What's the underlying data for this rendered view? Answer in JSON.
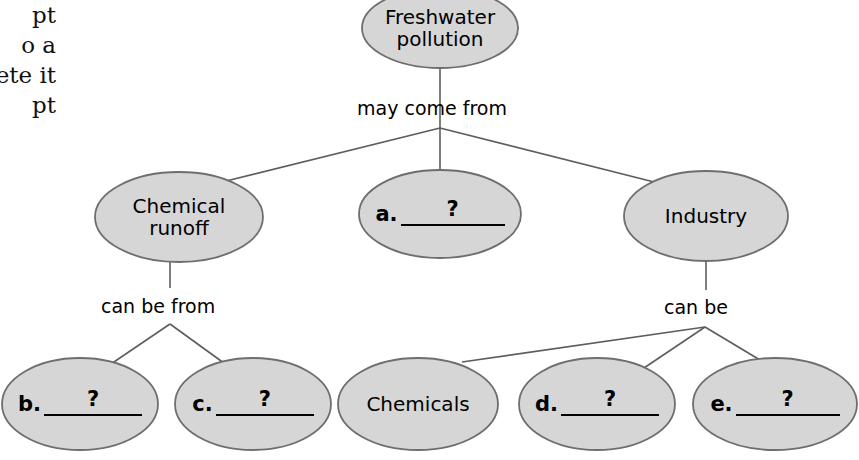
{
  "diagram": {
    "type": "concept-map",
    "colors": {
      "node_fill": "#d6d6d6",
      "node_stroke": "#6e6e6e",
      "edge_stroke": "#5d5d5d",
      "text": "#000000",
      "background": "#ffffff"
    },
    "margin_text": "pt\no a\nete it\npt",
    "nodes": [
      {
        "id": "root",
        "label": "Freshwater\npollution",
        "kind": "filled",
        "cx": 440,
        "cy": 28,
        "rx": 78,
        "ry": 40
      },
      {
        "id": "chemical-runoff",
        "label": "Chemical\nrunoff",
        "kind": "filled",
        "cx": 179,
        "cy": 217,
        "rx": 84,
        "ry": 45
      },
      {
        "id": "blank-a",
        "label": "a.",
        "question": "?",
        "kind": "blank",
        "cx": 440,
        "cy": 214,
        "rx": 81,
        "ry": 44
      },
      {
        "id": "industry",
        "label": "Industry",
        "kind": "filled",
        "cx": 706,
        "cy": 216,
        "rx": 82,
        "ry": 45
      },
      {
        "id": "blank-b",
        "label": "b.",
        "question": "?",
        "kind": "blank",
        "cx": 80,
        "cy": 404,
        "rx": 78,
        "ry": 46
      },
      {
        "id": "blank-c",
        "label": "c.",
        "question": "?",
        "kind": "blank",
        "cx": 253,
        "cy": 404,
        "rx": 78,
        "ry": 46
      },
      {
        "id": "chemicals",
        "label": "Chemicals",
        "kind": "filled",
        "cx": 418,
        "cy": 404,
        "rx": 80,
        "ry": 46
      },
      {
        "id": "blank-d",
        "label": "d.",
        "question": "?",
        "kind": "blank",
        "cx": 597,
        "cy": 404,
        "rx": 78,
        "ry": 46
      },
      {
        "id": "blank-e",
        "label": "e.",
        "question": "?",
        "kind": "blank",
        "cx": 775,
        "cy": 404,
        "rx": 82,
        "ry": 46
      }
    ],
    "link_labels": [
      {
        "id": "may-come-from",
        "text": "may come from",
        "x": 357,
        "y": 97
      },
      {
        "id": "can-be-from",
        "text": "can be from",
        "x": 101,
        "y": 295
      },
      {
        "id": "can-be",
        "text": "can be",
        "x": 664,
        "y": 296
      }
    ],
    "edges": [
      {
        "id": "root-to-fan",
        "from": "root",
        "to": "fan-top",
        "path": "M 440 68 L 440 128"
      },
      {
        "id": "fan-to-chemical-runoff",
        "from": "fan-top",
        "to": "chemical-runoff",
        "path": "M 440 128 L 222 182"
      },
      {
        "id": "fan-to-blank-a",
        "from": "fan-top",
        "to": "blank-a",
        "path": "M 440 128 L 440 170"
      },
      {
        "id": "fan-to-industry",
        "from": "fan-top",
        "to": "industry",
        "path": "M 440 128 L 662 184"
      },
      {
        "id": "chemical-runoff-stem",
        "from": "chemical-runoff",
        "to": "can-be-from",
        "path": "M 170 262 L 170 288"
      },
      {
        "id": "left-fan-to-b",
        "from": "can-be-from",
        "to": "blank-b",
        "path": "M 170 324 L 108 366"
      },
      {
        "id": "left-fan-to-c",
        "from": "can-be-from",
        "to": "blank-c",
        "path": "M 170 324 L 228 366"
      },
      {
        "id": "industry-stem",
        "from": "industry",
        "to": "can-be",
        "path": "M 706 261 L 706 290"
      },
      {
        "id": "right-fan-to-chemicals",
        "from": "can-be",
        "to": "chemicals",
        "path": "M 705 327 L 462 362"
      },
      {
        "id": "right-fan-to-d",
        "from": "can-be",
        "to": "blank-d",
        "path": "M 705 327 L 638 372"
      },
      {
        "id": "right-fan-to-e",
        "from": "can-be",
        "to": "blank-e",
        "path": "M 705 327 L 760 360"
      }
    ]
  }
}
